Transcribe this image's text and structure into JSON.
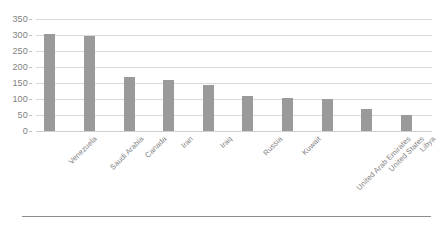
{
  "chart_data": {
    "type": "bar",
    "title": "",
    "subtitle": "",
    "xlabel": "",
    "ylabel": "",
    "categories": [
      "Venezuela",
      "Saudi Arabia",
      "Canada",
      "Iran",
      "Iraq",
      "Russia",
      "Kuwait",
      "United Arab Emirates",
      "United States",
      "Libya"
    ],
    "values": [
      303,
      298,
      169,
      158,
      144,
      108,
      102,
      100,
      70,
      49
    ],
    "ylim": [
      0,
      350
    ],
    "y_ticks": [
      0,
      50,
      100,
      150,
      200,
      250,
      300,
      350
    ],
    "y_tick_labels": [
      "0",
      "50",
      "100",
      "150",
      "200",
      "250",
      "300",
      "350"
    ],
    "grid": "horizontal",
    "legend": "none",
    "annotations": [],
    "colors": {
      "bar": "#9a9a9a",
      "gridline": "#d9d9d9",
      "tick_label": "#7f7f7f",
      "category_label": "#7f7f7f",
      "background": "#ffffff",
      "bottom_rule": "#8c8c8c"
    }
  }
}
